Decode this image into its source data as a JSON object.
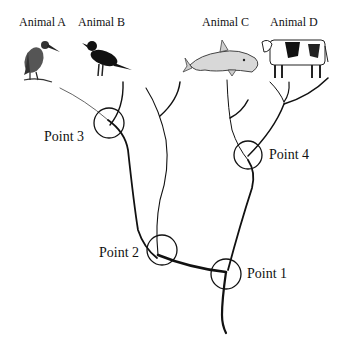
{
  "diagram": {
    "type": "phylogenetic-tree",
    "animals": [
      {
        "id": "A",
        "label": "Animal A",
        "icon": "heron-bird-icon"
      },
      {
        "id": "B",
        "label": "Animal B",
        "icon": "crow-bird-icon"
      },
      {
        "id": "C",
        "label": "Animal C",
        "icon": "dolphin-icon"
      },
      {
        "id": "D",
        "label": "Animal D",
        "icon": "cow-icon"
      }
    ],
    "points": [
      {
        "id": "1",
        "label": "Point 1"
      },
      {
        "id": "2",
        "label": "Point 2"
      },
      {
        "id": "3",
        "label": "Point 3"
      },
      {
        "id": "4",
        "label": "Point 4"
      }
    ],
    "colors": {
      "line": "#111111",
      "background": "#ffffff"
    }
  }
}
